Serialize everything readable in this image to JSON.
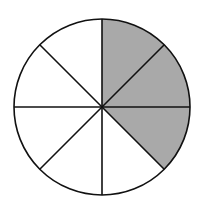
{
  "diagram": {
    "type": "fraction-circle",
    "total_sectors": 8,
    "shaded_sectors": 3,
    "shaded_indices_clockwise_from_top": [
      0,
      1,
      2
    ],
    "fraction": "3/8",
    "colors": {
      "shaded": "#a9a9a9",
      "unshaded": "#ffffff",
      "stroke": "#111111",
      "background": "#ffffff"
    },
    "geometry": {
      "cx": 102,
      "cy": 107,
      "r": 88
    }
  }
}
